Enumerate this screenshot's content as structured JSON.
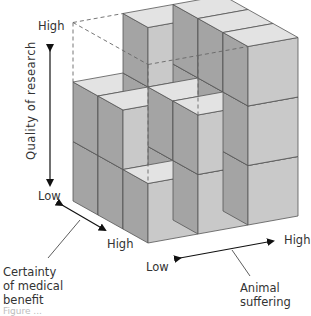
{
  "figure": {
    "type": "3D cube diagram",
    "axes": {
      "vertical": {
        "label": "Quality of research",
        "high": "High",
        "low": "Low"
      },
      "diagonal_left": {
        "label": "Certainty\nof medical\nbenefit",
        "low": "Low",
        "high": "High"
      },
      "diagonal_right": {
        "label": "Animal\nsuffering",
        "low": "Low",
        "high": "High"
      }
    },
    "grid": {
      "size": 3,
      "heights_front_to_back_left_to_right": [
        [
          1,
          2,
          3
        ],
        [
          2,
          2,
          3
        ],
        [
          2,
          3,
          3
        ]
      ],
      "removed_region_outline": "dashed"
    },
    "colors": {
      "top_face": "#e3e3e3",
      "front_face": "#c9c9c9",
      "side_face": "#a4a4a4",
      "edge": "#555555",
      "dashed": "#666666"
    },
    "caption_partial": "Figure ..."
  }
}
